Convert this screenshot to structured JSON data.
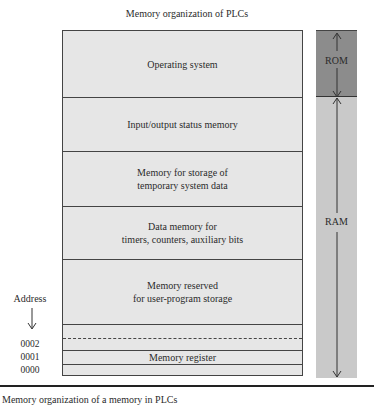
{
  "title": "Memory organization of PLCs",
  "memory_segments": [
    {
      "label": "Operating system"
    },
    {
      "label": "Input/output status memory"
    },
    {
      "label": "Memory for storage of\ntemporary system data"
    },
    {
      "label": "Data memory for\ntimers, counters, auxiliary bits"
    },
    {
      "label": "Memory reserved\nfor user-program storage"
    },
    {
      "label": ""
    },
    {
      "label": ""
    },
    {
      "label": "Memory register"
    },
    {
      "label": ""
    }
  ],
  "bars": {
    "rom": {
      "label": "ROM",
      "color": "#8c8c8c"
    },
    "ram": {
      "label": "RAM",
      "color": "#c9c9c9"
    }
  },
  "address": {
    "label": "Address",
    "values": [
      "0002",
      "0001",
      "0000"
    ]
  },
  "caption": "Memory organization of a memory in PLCs"
}
